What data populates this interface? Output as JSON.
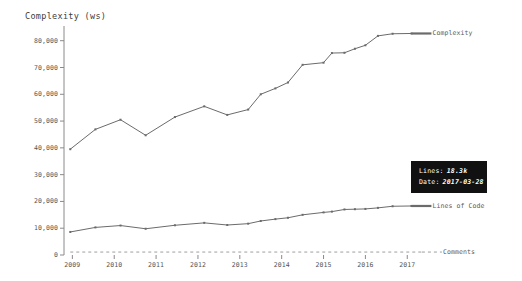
{
  "chart_data": {
    "type": "line",
    "title": "Complexity (ws)",
    "xlabel": "",
    "ylabel": "Complexity (ws)",
    "ylim": [
      0,
      84000
    ],
    "xlim": [
      2008.8,
      2017.4
    ],
    "grid": false,
    "legend_position": "right-inline",
    "ytick_labels": [
      "0",
      "10,000",
      "20,000",
      "30,000",
      "40,000",
      "50,000",
      "60,000",
      "70,000",
      "80,000"
    ],
    "ytick_values": [
      0,
      10000,
      20000,
      30000,
      40000,
      50000,
      60000,
      70000,
      80000
    ],
    "xtick_labels": [
      "2009",
      "2010",
      "2011",
      "2012",
      "2013",
      "2014",
      "2015",
      "2016",
      "2017"
    ],
    "xtick_values": [
      2009,
      2010,
      2011,
      2012,
      2013,
      2014,
      2015,
      2016,
      2017
    ],
    "series": [
      {
        "name": "Complexity",
        "color": "#6b6b6b",
        "style": "solid",
        "x": [
          2008.95,
          2009.55,
          2010.15,
          2010.75,
          2011.45,
          2012.15,
          2012.7,
          2013.2,
          2013.5,
          2013.85,
          2014.15,
          2014.5,
          2015.0,
          2015.2,
          2015.5,
          2015.75,
          2016.0,
          2016.3,
          2016.65,
          2017.1
        ],
        "values": [
          39500,
          46900,
          50500,
          44700,
          51500,
          55500,
          52300,
          54300,
          60000,
          62200,
          64400,
          71000,
          71800,
          75400,
          75500,
          77000,
          78300,
          81800,
          82600,
          82700
        ]
      },
      {
        "name": "Lines of Code",
        "color": "#6b6b6b",
        "style": "solid",
        "x": [
          2008.95,
          2009.55,
          2010.15,
          2010.75,
          2011.45,
          2012.15,
          2012.7,
          2013.2,
          2013.5,
          2013.85,
          2014.15,
          2014.5,
          2015.0,
          2015.2,
          2015.5,
          2015.75,
          2016.0,
          2016.3,
          2016.65,
          2017.1
        ],
        "values": [
          8600,
          10300,
          11000,
          9800,
          11100,
          12000,
          11200,
          11700,
          12700,
          13400,
          13900,
          15000,
          15900,
          16200,
          17000,
          17100,
          17200,
          17600,
          18200,
          18300
        ]
      },
      {
        "name": "Comments",
        "color": "#9e9e9e",
        "style": "dashed",
        "x": [
          2008.95,
          2017.35
        ],
        "values": [
          1100,
          1100
        ]
      }
    ],
    "tooltip": {
      "rows": [
        {
          "key": "Lines:",
          "value": "18.3k"
        },
        {
          "key": "Date:",
          "value": "2017-03-28"
        }
      ]
    }
  }
}
